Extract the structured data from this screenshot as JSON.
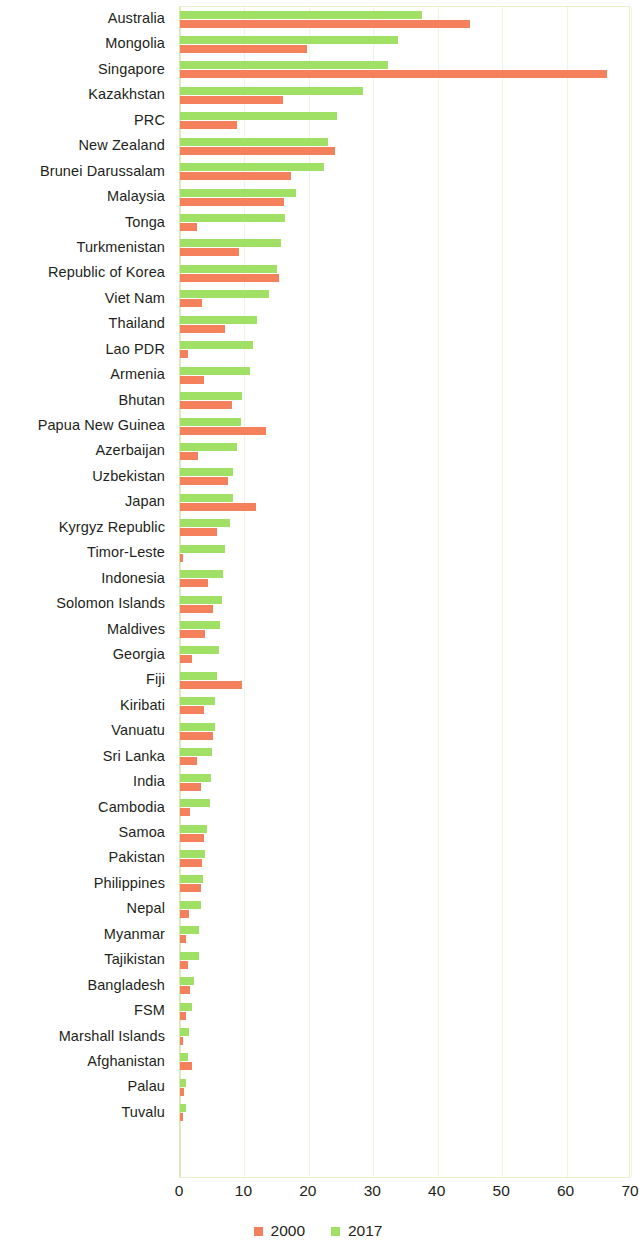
{
  "chart_data": {
    "type": "bar",
    "orientation": "horizontal",
    "title": "",
    "subtitle": "",
    "xlabel": "",
    "ylabel": "",
    "xlim": [
      0,
      70
    ],
    "xticks": [
      0,
      10,
      20,
      30,
      40,
      50,
      60,
      70
    ],
    "xtick_labels": [
      "0",
      "10",
      "20",
      "30",
      "40",
      "50",
      "60",
      "70"
    ],
    "grid": true,
    "grid_axis": "x",
    "legend_position": "bottom-center",
    "colors": {
      "2000": "#f4815c",
      "2017": "#9fe065",
      "grid": "#eef4dd",
      "border": "#e8f2c8",
      "text": "#231f20"
    },
    "categories": [
      "Australia",
      "Mongolia",
      "Singapore",
      "Kazakhstan",
      "PRC",
      "New Zealand",
      "Brunei Darussalam",
      "Malaysia",
      "Tonga",
      "Turkmenistan",
      "Republic of Korea",
      "Viet Nam",
      "Thailand",
      "Lao PDR",
      "Armenia",
      "Bhutan",
      "Papua New Guinea",
      "Azerbaijan",
      "Uzbekistan",
      "Japan",
      "Kyrgyz Republic",
      "Timor-Leste",
      "Indonesia",
      "Solomon Islands",
      "Maldives",
      "Georgia",
      "Fiji",
      "Kiribati",
      "Vanuatu",
      "Sri Lanka",
      "India",
      "Cambodia",
      "Samoa",
      "Pakistan",
      "Philippines",
      "Nepal",
      "Myanmar",
      "Tajikistan",
      "Bangladesh",
      "FSM",
      "Marshall Islands",
      "Afghanistan",
      "Palau",
      "Tuvalu"
    ],
    "series": [
      {
        "name": "2000",
        "color": "#f4815c",
        "values": [
          45.0,
          19.7,
          66.2,
          16.0,
          8.9,
          24.0,
          17.2,
          16.2,
          2.6,
          9.2,
          15.4,
          3.4,
          7.0,
          1.3,
          3.8,
          8.0,
          13.3,
          2.8,
          7.5,
          11.8,
          5.8,
          0.5,
          4.4,
          5.1,
          3.9,
          1.9,
          9.6,
          3.7,
          5.1,
          2.7,
          3.2,
          1.5,
          3.7,
          3.4,
          3.3,
          1.4,
          1.0,
          1.3,
          1.6,
          0.9,
          0.4,
          1.9,
          0.6,
          0.5
        ]
      },
      {
        "name": "2017",
        "color": "#9fe065",
        "values": [
          37.5,
          33.8,
          32.3,
          28.4,
          24.3,
          23.0,
          22.4,
          18.0,
          16.3,
          15.7,
          15.0,
          13.8,
          12.0,
          11.3,
          10.8,
          9.6,
          9.5,
          8.9,
          8.3,
          8.3,
          7.8,
          7.0,
          6.7,
          6.5,
          6.2,
          6.0,
          5.7,
          5.5,
          5.4,
          5.0,
          4.8,
          4.6,
          4.2,
          3.9,
          3.6,
          3.2,
          3.0,
          3.0,
          2.1,
          1.8,
          1.4,
          1.3,
          1.0,
          0.9
        ]
      }
    ]
  },
  "legend": {
    "items": [
      {
        "label": "2000",
        "color": "#f4815c",
        "swatch": "square-swatch-2000"
      },
      {
        "label": "2017",
        "color": "#9fe065",
        "swatch": "square-swatch-2017"
      }
    ]
  }
}
